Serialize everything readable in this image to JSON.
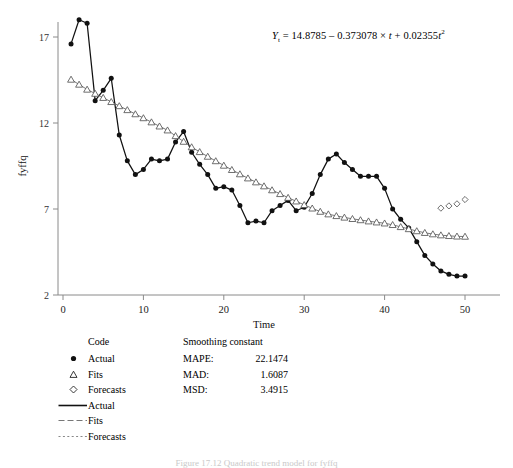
{
  "figure": {
    "equation_text": "Yt = 14.8785 - 0.373078 x t + 0.02355t2",
    "equation_parts": {
      "lhs_var": "Y",
      "lhs_sub": "t",
      "eq": "=",
      "intercept": "14.8785",
      "minus": "–",
      "linear_coef": "0.373078",
      "times": "×",
      "t1": "t",
      "plus": "+",
      "quad_coef": "0.02355",
      "t2": "t",
      "exp2": "2"
    },
    "caption": "Figure 17.12   Quadratic trend model for fyffq"
  },
  "axes": {
    "ylabel": "fyffq",
    "xlabel": "Time",
    "yticks": [
      2,
      7,
      12,
      17
    ],
    "xticks": [
      0,
      10,
      20,
      30,
      40,
      50
    ],
    "ylim": [
      2,
      19.2
    ],
    "xlim": [
      -1.2,
      52
    ]
  },
  "legend": {
    "code_header": "Code",
    "smoothing_header": "Smoothing constant",
    "marker_items": [
      {
        "label": "Actual",
        "marker": "filled-circle-icon"
      },
      {
        "label": "Fits",
        "marker": "open-triangle-icon"
      },
      {
        "label": "Forecasts",
        "marker": "open-diamond-icon"
      }
    ],
    "line_items": [
      {
        "label": "Actual",
        "style": "solid-line-icon"
      },
      {
        "label": "Fits",
        "style": "dashed-line-icon"
      },
      {
        "label": "Forecasts",
        "style": "dotted-line-icon"
      }
    ],
    "stats": [
      {
        "name": "MAPE:",
        "value": "22.1474"
      },
      {
        "name": "MAD:",
        "value": "1.6087"
      },
      {
        "name": "MSD:",
        "value": "3.4915"
      }
    ]
  },
  "colors": {
    "axis": "#8a8a8a",
    "actual": "#111111",
    "fits": "#555555",
    "forecasts": "#555555",
    "background": "#ffffff"
  },
  "chart_data": {
    "type": "line",
    "title": "",
    "xlabel": "Time",
    "ylabel": "fyffq",
    "xlim": [
      -1.2,
      52
    ],
    "ylim": [
      2,
      19.2
    ],
    "grid": false,
    "legend_position": "below-left",
    "annotation": "Yt = 14.8785 - 0.373078 x t + 0.02355t^2",
    "series": [
      {
        "name": "Actual",
        "marker": "filled-circle",
        "linestyle": "solid",
        "x": [
          1,
          2,
          3,
          4,
          5,
          6,
          7,
          8,
          9,
          10,
          11,
          12,
          13,
          14,
          15,
          16,
          17,
          18,
          19,
          20,
          21,
          22,
          23,
          24,
          25,
          26,
          27,
          28,
          29,
          30,
          31,
          32,
          33,
          34,
          35,
          36,
          37,
          38,
          39,
          40,
          41,
          42,
          43,
          44,
          45,
          46,
          47,
          48,
          49,
          50
        ],
        "values": [
          16.6,
          18.0,
          17.8,
          13.3,
          13.9,
          14.6,
          11.3,
          9.8,
          9.0,
          9.3,
          9.9,
          9.8,
          9.9,
          10.9,
          11.5,
          10.3,
          9.6,
          9.0,
          8.2,
          8.3,
          8.1,
          7.2,
          6.2,
          6.3,
          6.2,
          6.9,
          7.2,
          7.5,
          6.9,
          7.1,
          7.9,
          9.0,
          9.9,
          10.2,
          9.7,
          9.3,
          8.9,
          8.9,
          8.9,
          8.2,
          7.0,
          6.4,
          5.9,
          5.1,
          4.3,
          3.8,
          3.4,
          3.2,
          3.1,
          3.1
        ]
      },
      {
        "name": "Fits",
        "marker": "open-triangle",
        "linestyle": "solid-thin",
        "x": [
          1,
          2,
          3,
          4,
          5,
          6,
          7,
          8,
          9,
          10,
          11,
          12,
          13,
          14,
          15,
          16,
          17,
          18,
          19,
          20,
          21,
          22,
          23,
          24,
          25,
          26,
          27,
          28,
          29,
          30,
          31,
          32,
          33,
          34,
          35,
          36,
          37,
          38,
          39,
          40,
          41,
          42,
          43,
          44,
          45,
          46,
          47,
          48,
          49,
          50
        ],
        "values": [
          14.53,
          14.24,
          13.95,
          13.71,
          13.47,
          13.23,
          12.99,
          12.76,
          12.52,
          12.29,
          12.05,
          11.81,
          11.58,
          11.25,
          10.92,
          10.6,
          10.32,
          10.05,
          9.79,
          9.53,
          9.28,
          9.03,
          8.79,
          8.56,
          8.33,
          8.1,
          7.88,
          7.66,
          7.45,
          7.24,
          7.04,
          6.85,
          6.7,
          6.6,
          6.51,
          6.43,
          6.36,
          6.29,
          6.23,
          6.17,
          6.08,
          5.96,
          5.84,
          5.72,
          5.62,
          5.54,
          5.48,
          5.44,
          5.41,
          5.4
        ]
      },
      {
        "name": "Forecasts",
        "marker": "open-diamond",
        "linestyle": "none",
        "x": [
          47,
          48,
          49,
          50
        ],
        "values": [
          7.05,
          7.18,
          7.3,
          7.55
        ]
      }
    ],
    "statistics": {
      "MAPE": 22.1474,
      "MAD": 1.6087,
      "MSD": 3.4915
    }
  }
}
